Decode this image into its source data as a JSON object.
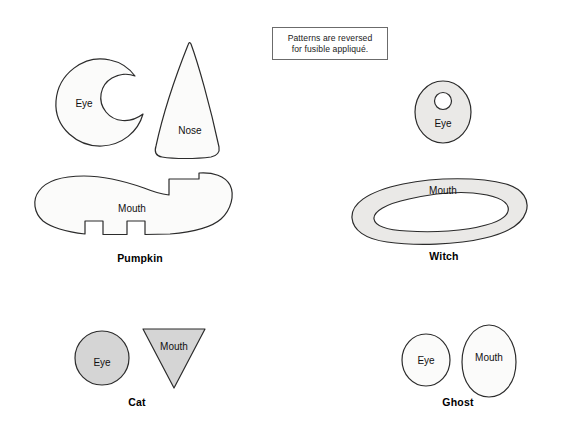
{
  "document": {
    "title": "Halloween Appliqué Face Patterns",
    "background_color": "#ffffff",
    "width": 567,
    "height": 439
  },
  "note": {
    "name": "fusible-applique-note",
    "line1": "Patterns are reversed",
    "line2": "for fusible appliqué.",
    "border_color": "#6b6b6b",
    "background_color": "#ffffff"
  },
  "palette": {
    "outline": "#2b2b2b",
    "white_fill": "#fbfbfa",
    "light_gray_fill": "#eae9e7",
    "mid_gray_fill": "#d5d5d5",
    "text": "#111111",
    "label_text": "#000000"
  },
  "groups": [
    {
      "id": "pumpkin",
      "label": "Pumpkin",
      "label_x": 140,
      "label_y": 252,
      "pieces": [
        {
          "id": "pumpkin-eye",
          "label": "Eye",
          "shape": "crescent",
          "fill": "#fbfbfa"
        },
        {
          "id": "pumpkin-nose",
          "label": "Nose",
          "shape": "cone",
          "fill": "#fbfbfa"
        },
        {
          "id": "pumpkin-mouth",
          "label": "Mouth",
          "shape": "toothy-grin",
          "fill": "#fbfbfa"
        }
      ]
    },
    {
      "id": "witch",
      "label": "Witch",
      "label_x": 444,
      "label_y": 255,
      "pieces": [
        {
          "id": "witch-eye",
          "label": "Eye",
          "shape": "oval-with-hole",
          "fill": "#eae9e7"
        },
        {
          "id": "witch-mouth",
          "label": "Mouth",
          "shape": "crescent-band",
          "fill": "#eae9e7"
        }
      ]
    },
    {
      "id": "cat",
      "label": "Cat",
      "label_x": 137,
      "label_y": 401,
      "pieces": [
        {
          "id": "cat-eye",
          "label": "Eye",
          "shape": "circle",
          "fill": "#d5d5d5"
        },
        {
          "id": "cat-mouth",
          "label": "Mouth",
          "shape": "triangle-down",
          "fill": "#d5d5d5"
        }
      ]
    },
    {
      "id": "ghost",
      "label": "Ghost",
      "label_x": 458,
      "label_y": 401,
      "pieces": [
        {
          "id": "ghost-eye",
          "label": "Eye",
          "shape": "oval",
          "fill": "#fbfbfa"
        },
        {
          "id": "ghost-mouth",
          "label": "Mouth",
          "shape": "egg",
          "fill": "#fbfbfa"
        }
      ]
    }
  ]
}
